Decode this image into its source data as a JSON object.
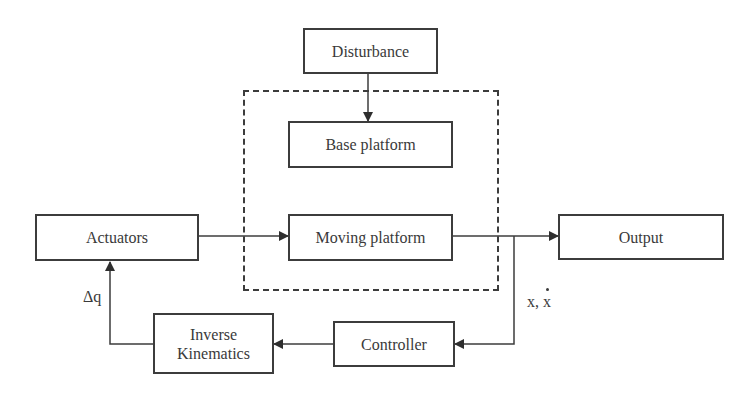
{
  "diagram": {
    "type": "block-diagram",
    "blocks": {
      "disturbance": "Disturbance",
      "base_platform": "Base platform",
      "actuators": "Actuators",
      "moving_platform": "Moving platform",
      "output": "Output",
      "controller": "Controller",
      "inverse_kinematics_line1": "Inverse",
      "inverse_kinematics_line2": "Kinematics"
    },
    "signals": {
      "delta_q": "Δq",
      "state_x": "x,",
      "state_xdot": "x"
    },
    "connections": [
      {
        "from": "Disturbance",
        "to": "Base platform"
      },
      {
        "from": "Actuators",
        "to": "Moving platform"
      },
      {
        "from": "Moving platform",
        "to": "Output"
      },
      {
        "from": "Moving platform",
        "to": "Controller",
        "label": "x, ẋ"
      },
      {
        "from": "Controller",
        "to": "Inverse Kinematics"
      },
      {
        "from": "Inverse Kinematics",
        "to": "Actuators",
        "label": "Δq"
      }
    ],
    "groups": [
      {
        "name": "platform-group",
        "style": "dashed",
        "members": [
          "Base platform",
          "Moving platform"
        ]
      }
    ]
  }
}
